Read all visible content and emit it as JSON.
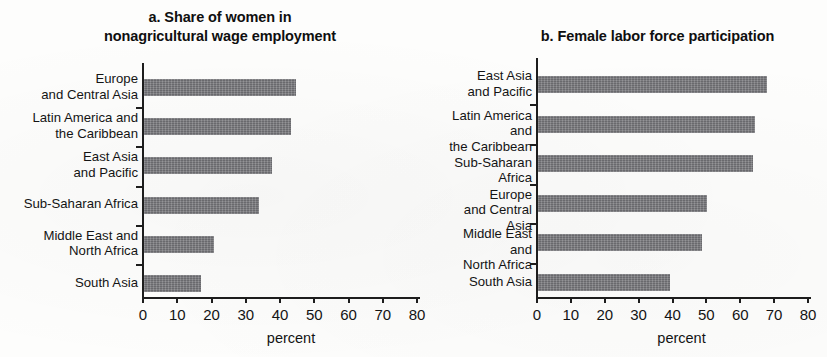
{
  "figure": {
    "panels": [
      {
        "id": "a",
        "title": "a. Share of women in\nnonagricultural wage employment",
        "axis_caption": "percent"
      },
      {
        "id": "b",
        "title": "b. Female labor force participation",
        "axis_caption": "percent"
      }
    ],
    "tick_labels": [
      "0",
      "10",
      "20",
      "30",
      "40",
      "50",
      "60",
      "70",
      "80"
    ],
    "bar_color": "#76767a",
    "axis_color": "#1d1d1d"
  },
  "chart_data": [
    {
      "type": "bar",
      "orientation": "horizontal",
      "title": "a. Share of women in nonagricultural wage employment",
      "xlabel": "percent",
      "ylabel": "",
      "xlim": [
        0,
        80
      ],
      "xticks": [
        0,
        10,
        20,
        30,
        40,
        50,
        60,
        70,
        80
      ],
      "grid": false,
      "legend": "none",
      "categories": [
        "Europe\nand Central Asia",
        "Latin America and\nthe Caribbean",
        "East Asia\nand Pacific",
        "Sub-Saharan Africa",
        "Middle East and\nNorth Africa",
        "South Asia"
      ],
      "values": [
        44.5,
        43,
        37.5,
        33.5,
        20.5,
        16.5
      ]
    },
    {
      "type": "bar",
      "orientation": "horizontal",
      "title": "b. Female labor force participation",
      "xlabel": "percent",
      "ylabel": "",
      "xlim": [
        0,
        80
      ],
      "xticks": [
        0,
        10,
        20,
        30,
        40,
        50,
        60,
        70,
        80
      ],
      "grid": false,
      "legend": "none",
      "categories": [
        "East Asia\nand Pacific",
        "Latin America and\nthe Caribbean",
        "Sub-Saharan Africa",
        "Europe\nand Central Asia",
        "Middle East and\nNorth Africa",
        "South Asia"
      ],
      "values": [
        67.5,
        64,
        63.5,
        50,
        48.5,
        39
      ]
    }
  ]
}
